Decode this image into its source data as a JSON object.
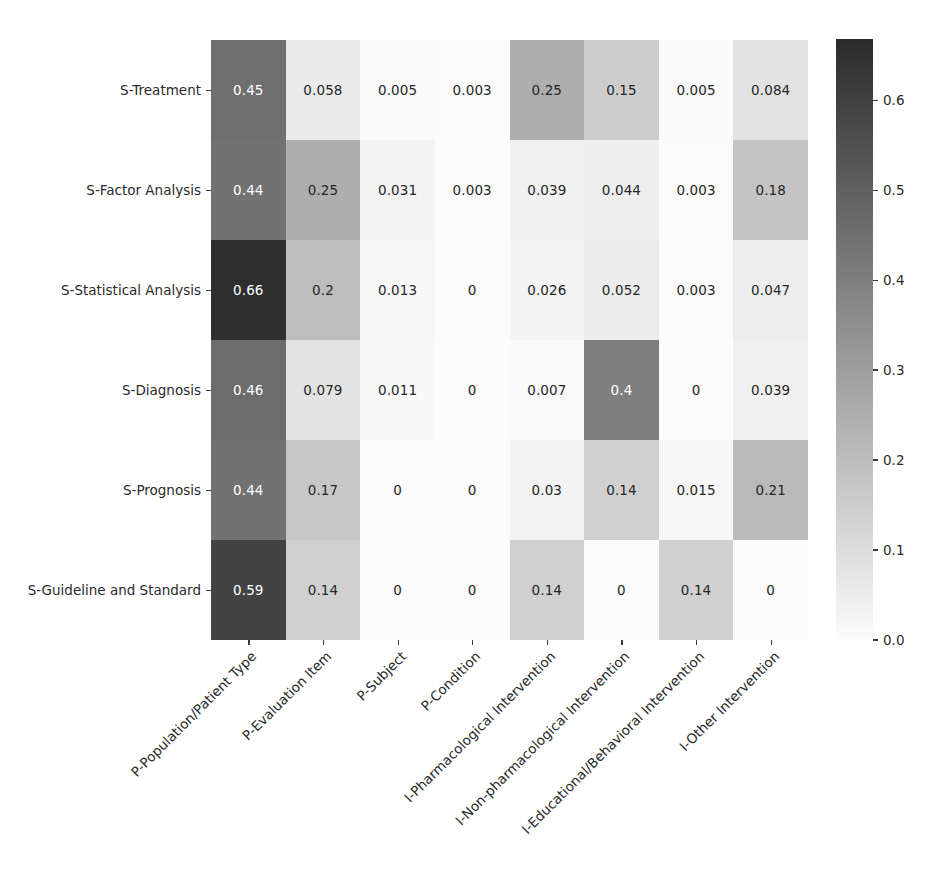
{
  "chart_data": {
    "type": "heatmap",
    "title": "",
    "xlabel": "",
    "ylabel": "",
    "grid": false,
    "legend_position": "right-colorbar",
    "x_categories": [
      "P-Population/Patient Type",
      "P-Evaluation Item",
      "P-Subject",
      "P-Condition",
      "I-Pharmacological Intervention",
      "I-Non-pharmacological Intervention",
      "I-Educational/Behavioral Intervention",
      "I-Other Intervention"
    ],
    "y_categories": [
      "S-Treatment",
      "S-Factor Analysis",
      "S-Statistical Analysis",
      "S-Diagnosis",
      "S-Prognosis",
      "S-Guideline and Standard"
    ],
    "values": [
      [
        0.45,
        0.058,
        0.005,
        0.003,
        0.25,
        0.15,
        0.005,
        0.084
      ],
      [
        0.44,
        0.25,
        0.031,
        0.003,
        0.039,
        0.044,
        0.003,
        0.18
      ],
      [
        0.66,
        0.2,
        0.013,
        0,
        0.026,
        0.052,
        0.003,
        0.047
      ],
      [
        0.46,
        0.079,
        0.011,
        0,
        0.007,
        0.4,
        0,
        0.039
      ],
      [
        0.44,
        0.17,
        0,
        0,
        0.03,
        0.14,
        0.015,
        0.21
      ],
      [
        0.59,
        0.14,
        0,
        0,
        0.14,
        0,
        0.14,
        0
      ]
    ],
    "cell_labels": [
      [
        "0.45",
        "0.058",
        "0.005",
        "0.003",
        "0.25",
        "0.15",
        "0.005",
        "0.084"
      ],
      [
        "0.44",
        "0.25",
        "0.031",
        "0.003",
        "0.039",
        "0.044",
        "0.003",
        "0.18"
      ],
      [
        "0.66",
        "0.2",
        "0.013",
        "0",
        "0.026",
        "0.052",
        "0.003",
        "0.047"
      ],
      [
        "0.46",
        "0.079",
        "0.011",
        "0",
        "0.007",
        "0.4",
        "0",
        "0.039"
      ],
      [
        "0.44",
        "0.17",
        "0",
        "0",
        "0.03",
        "0.14",
        "0.015",
        "0.21"
      ],
      [
        "0.59",
        "0.14",
        "0",
        "0",
        "0.14",
        "0",
        "0.14",
        "0"
      ]
    ],
    "colorbar": {
      "ticks": [
        "0.6",
        "0.5",
        "0.4",
        "0.3",
        "0.2",
        "0.1",
        "0.0"
      ],
      "tick_values": [
        0.6,
        0.5,
        0.4,
        0.3,
        0.2,
        0.1,
        0.0
      ],
      "vmin": 0.0,
      "vmax": 0.668,
      "colormap": "greys",
      "color_low": "#fcfcfc",
      "color_high": "#2b2b2b"
    }
  }
}
